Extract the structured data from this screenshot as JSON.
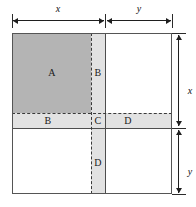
{
  "figure": {
    "regions": [
      {
        "id": "A",
        "label": "A",
        "shade": "dark",
        "x": 12,
        "y": 33,
        "w": 79,
        "h": 80
      },
      {
        "id": "B-vertical",
        "label": "B",
        "shade": "light",
        "x": 91,
        "y": 33,
        "w": 14,
        "h": 80
      },
      {
        "id": "B-horizontal",
        "label": "B",
        "shade": "light",
        "x": 12,
        "y": 113,
        "w": 79,
        "h": 15
      },
      {
        "id": "C",
        "label": "C",
        "shade": "light",
        "x": 91,
        "y": 113,
        "w": 14,
        "h": 15
      },
      {
        "id": "D-horizontal",
        "label": "D",
        "shade": "light",
        "x": 105,
        "y": 113,
        "w": 67,
        "h": 15
      },
      {
        "id": "D-vertical",
        "label": "D",
        "shade": "light",
        "x": 91,
        "y": 128,
        "w": 14,
        "h": 66
      },
      {
        "id": "top-right",
        "label": "",
        "shade": "white",
        "x": 105,
        "y": 33,
        "w": 67,
        "h": 80
      },
      {
        "id": "bottom-left",
        "label": "",
        "shade": "white",
        "x": 12,
        "y": 128,
        "w": 79,
        "h": 66
      },
      {
        "id": "bottom-right",
        "label": "",
        "shade": "white",
        "x": 105,
        "y": 128,
        "w": 67,
        "h": 66
      }
    ],
    "region_labels": [
      {
        "text": "A",
        "x": 52,
        "y": 73
      },
      {
        "text": "B",
        "x": 98,
        "y": 73
      },
      {
        "text": "B",
        "x": 48,
        "y": 121
      },
      {
        "text": "C",
        "x": 98,
        "y": 121
      },
      {
        "text": "D",
        "x": 128,
        "y": 121
      },
      {
        "text": "D",
        "x": 98,
        "y": 163
      }
    ],
    "dimensions": [
      {
        "name": "top-x",
        "label": "x",
        "orientation": "horizontal",
        "start": 13,
        "end": 104,
        "axis": 20,
        "label_x": 58,
        "label_y": 13
      },
      {
        "name": "top-y",
        "label": "y",
        "orientation": "horizontal",
        "start": 107,
        "end": 171,
        "axis": 20,
        "label_x": 139,
        "label_y": 13
      },
      {
        "name": "right-x",
        "label": "x",
        "orientation": "vertical",
        "start": 36,
        "end": 126,
        "axis": 178,
        "label_x": 189,
        "label_y": 91
      },
      {
        "name": "right-y",
        "label": "y",
        "orientation": "vertical",
        "start": 131,
        "end": 193,
        "axis": 178,
        "label_x": 189,
        "label_y": 172
      }
    ],
    "geometry": {
      "square_left": 12,
      "square_top": 33,
      "square_right": 172,
      "square_bottom": 194,
      "divider_vertical_solid": 105,
      "divider_vertical_dashed": 91,
      "divider_horizontal_solid": 128,
      "divider_horizontal_dashed": 113
    },
    "colors": {
      "dark_fill": "#b4b4b4",
      "light_fill": "#e2e2e2",
      "white_fill": "#ffffff",
      "line": "#4d4d4d",
      "dash_line": "#3a3a3a",
      "arrow": "#1f1f1f",
      "background": "#ffffff"
    }
  }
}
